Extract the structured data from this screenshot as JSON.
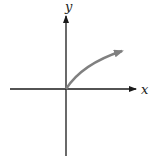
{
  "diagram": {
    "type": "coordinate-axes-with-curve",
    "x_axis_label": "x",
    "y_axis_label": "y",
    "curve": {
      "description": "increasing concave-down curve from origin (square-root shape) with arrowhead",
      "color": "#808080"
    },
    "axis_color": "#1a1a1a"
  }
}
